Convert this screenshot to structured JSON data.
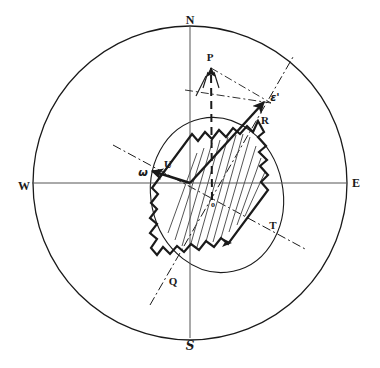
{
  "figure": {
    "type": "crystal-optical-indicatrix-stereogram",
    "background_color": "#ffffff",
    "ink_color": "#1a1a1a",
    "width": 380,
    "height": 368
  },
  "outer_circle": {
    "name": "primitive-circle",
    "center_x": 190,
    "center_y": 183,
    "radius": 157,
    "stroke": "#1a1a1a",
    "stroke_width": 1.3
  },
  "inner_ellipse": {
    "name": "vibration-ellipse",
    "center_x": 217,
    "center_y": 195,
    "rx": 66,
    "ry": 78,
    "rotation_deg": -12,
    "stroke": "#1a1a1a",
    "stroke_width": 1.1
  },
  "axes": {
    "vertical": {
      "x": 190,
      "y1": 27,
      "y2": 338
    },
    "horizontal": {
      "y": 183,
      "x1": 32,
      "x2": 347
    }
  },
  "cardinals": [
    {
      "id": "north",
      "label": "N",
      "x": 190,
      "y": 20
    },
    {
      "id": "east",
      "label": "E",
      "x": 356,
      "y": 183
    },
    {
      "id": "south",
      "label": "S",
      "x": 190,
      "y": 346
    },
    {
      "id": "west",
      "label": "W",
      "x": 24,
      "y": 186
    }
  ],
  "points": [
    {
      "id": "P",
      "label": "P",
      "x": 210,
      "y": 57,
      "style": "point"
    },
    {
      "id": "epsilon",
      "label": "ε'",
      "x": 275,
      "y": 97,
      "style": "greek"
    },
    {
      "id": "R",
      "label": "R",
      "x": 265,
      "y": 120,
      "style": "point"
    },
    {
      "id": "U",
      "label": "U",
      "x": 168,
      "y": 164,
      "style": "point"
    },
    {
      "id": "omega",
      "label": "ω",
      "x": 143,
      "y": 172,
      "style": "greek"
    },
    {
      "id": "O",
      "label": "o",
      "x": 213,
      "y": 205,
      "style": "small"
    },
    {
      "id": "T",
      "label": "T",
      "x": 273,
      "y": 225,
      "style": "point"
    },
    {
      "id": "Q",
      "label": "Q",
      "x": 173,
      "y": 281,
      "style": "point"
    }
  ],
  "vectors": [
    {
      "id": "OP",
      "name": "dashed-vector-OP",
      "from_x": 212,
      "from_y": 200,
      "to_x": 211,
      "to_y": 68,
      "dash": "8,5",
      "stroke_width": 2.0,
      "arrow": true
    },
    {
      "id": "OR",
      "name": "solid-vector-OR",
      "from_x": 190,
      "from_y": 183,
      "to_x": 264,
      "to_y": 102,
      "dash": "none",
      "stroke_width": 2.4,
      "arrow": true
    },
    {
      "id": "OU",
      "name": "solid-vector-OU",
      "from_x": 190,
      "from_y": 183,
      "to_x": 152,
      "to_y": 171,
      "dash": "none",
      "stroke_width": 2.4,
      "arrow": true
    }
  ],
  "construction_lines": [
    {
      "id": "QE",
      "name": "dash-dot-axis-Q-epsilon",
      "x1": 150,
      "y1": 305,
      "x2": 293,
      "y2": 57
    },
    {
      "id": "WT",
      "name": "dash-dot-axis-omega-T",
      "x1": 113,
      "y1": 145,
      "x2": 307,
      "y2": 250
    },
    {
      "id": "PE",
      "name": "dash-dot-parallelogram-P-epsilon",
      "x1": 211,
      "y1": 68,
      "x2": 271,
      "y2": 103
    },
    {
      "id": "OE2",
      "name": "dash-dot-parallelogram-O-epsilon",
      "x1": 185,
      "y1": 90,
      "x2": 271,
      "y2": 103
    }
  ],
  "crystal": {
    "name": "crystal-section-outline",
    "description": "elongated prismatic crystal section, jagged outline, hatched interior, long axis tilted NE-SW",
    "long_axis_deg": 32,
    "hatch_stroke": "#555555",
    "outline_stroke": "#1a1a1a",
    "outline_width": 2.2,
    "outline_path": "M 258,121 L 264,132 L 258,137 L 266,146 L 259,152 L 267,160 L 260,166 L 268,175 L 261,182 L 268,190 L 228,244 L 221,238 L 214,247 L 206,241 L 199,250 L 191,244 L 184,252 L 177,246 L 170,254 L 163,247 L 157,255 L 151,248 L 157,239 L 150,233 L 157,224 L 150,218 L 157,209 L 151,203 L 158,194 L 152,188 L 192,134 L 198,141 L 205,132 L 212,139 L 219,130 L 226,137 L 233,128 L 240,134 L 247,126 L 253,132 Z",
    "hatch_lines": [
      {
        "x1": 197,
        "y1": 153,
        "x2": 168,
        "y2": 233
      },
      {
        "x1": 204,
        "y1": 148,
        "x2": 175,
        "y2": 240
      },
      {
        "x1": 212,
        "y1": 143,
        "x2": 182,
        "y2": 246
      },
      {
        "x1": 220,
        "y1": 140,
        "x2": 190,
        "y2": 247
      },
      {
        "x1": 228,
        "y1": 137,
        "x2": 197,
        "y2": 247
      },
      {
        "x1": 236,
        "y1": 135,
        "x2": 205,
        "y2": 245
      },
      {
        "x1": 243,
        "y1": 134,
        "x2": 213,
        "y2": 242
      },
      {
        "x1": 250,
        "y1": 137,
        "x2": 221,
        "y2": 238
      },
      {
        "x1": 256,
        "y1": 146,
        "x2": 229,
        "y2": 232
      },
      {
        "x1": 261,
        "y1": 158,
        "x2": 237,
        "y2": 225
      },
      {
        "x1": 265,
        "y1": 172,
        "x2": 245,
        "y2": 216
      }
    ]
  }
}
